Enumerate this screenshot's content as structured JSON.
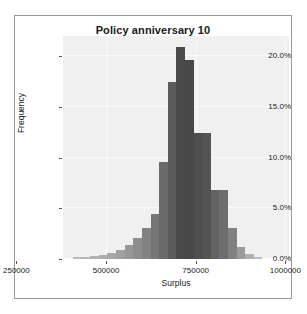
{
  "chart_data": {
    "type": "bar",
    "title": "Policy anniversary 10",
    "xlabel": "Surplus",
    "ylabel": "Frequency",
    "xlim": [
      380000,
      1010000
    ],
    "ylim": [
      0,
      22
    ],
    "grid": true,
    "legend": null,
    "xtick_labels": [
      "250000",
      "500000",
      "750000",
      "1000000"
    ],
    "xtick_values": [
      250000,
      500000,
      750000,
      1000000
    ],
    "ytick_labels": [
      "0.0%",
      "5.0%",
      "10.0%",
      "15.0%",
      "20.0%"
    ],
    "ytick_values": [
      0,
      5,
      10,
      15,
      20
    ],
    "bin_width": 24000,
    "bin_centers": [
      420000,
      444000,
      468000,
      492000,
      516000,
      540000,
      564000,
      588000,
      612000,
      636000,
      660000,
      684000,
      708000,
      732000,
      756000,
      780000,
      804000,
      828000,
      852000,
      876000,
      900000,
      924000
    ],
    "values": [
      0.15,
      0.2,
      0.3,
      0.4,
      0.6,
      0.9,
      1.4,
      2.1,
      3.1,
      4.4,
      9.6,
      17.5,
      20.9,
      19.6,
      12.4,
      12.4,
      6.8,
      6.8,
      3.1,
      1.2,
      0.5,
      0.2
    ],
    "bar_colors": [
      "#b9b9b9",
      "#b6b6b6",
      "#b2b2b2",
      "#aeaeae",
      "#a8a8a8",
      "#a0a0a0",
      "#979797",
      "#8d8d8d",
      "#828282",
      "#767676",
      "#6a6a6a",
      "#5c5c5c",
      "#4a4a4a",
      "#484848",
      "#4e4e4e",
      "#545454",
      "#636363",
      "#6e6e6e",
      "#808080",
      "#9a9a9a",
      "#b0b0b0",
      "#bdbdbd"
    ],
    "plot_background": "#f0f0f0",
    "frame_color": "#9a9a9a",
    "text_color": "#1a1a1a"
  }
}
